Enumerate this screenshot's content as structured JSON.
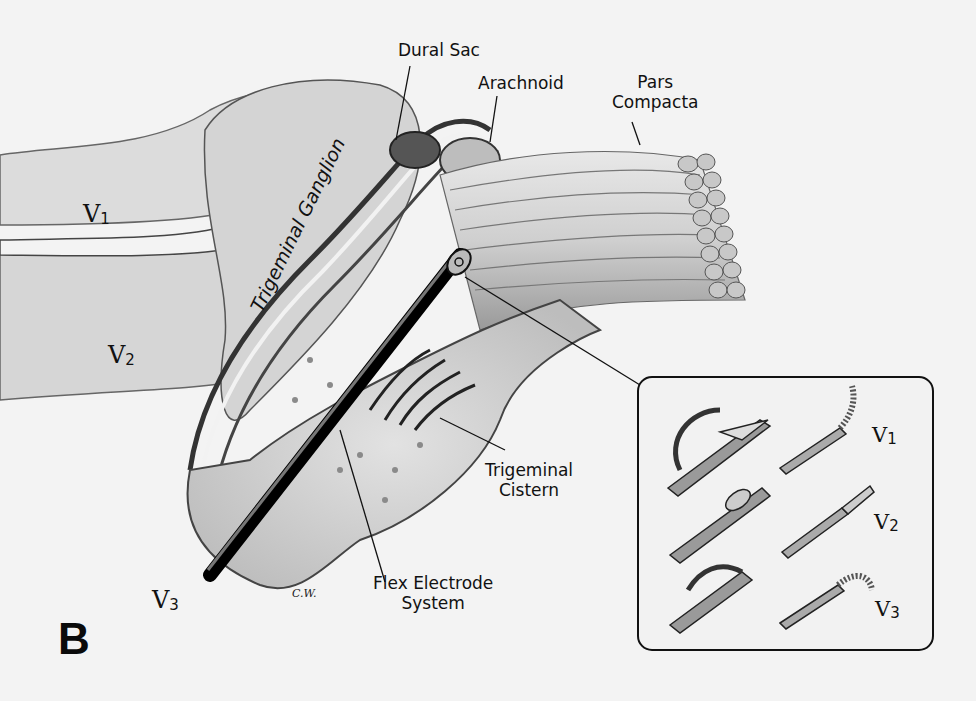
{
  "figure": {
    "panel_label": "B",
    "signature": "C.W.",
    "labels": {
      "dural_sac": "Dural Sac",
      "arachnoid": "Arachnoid",
      "pars_compacta": "Pars\nCompacta",
      "trigeminal_ganglion": "Trigeminal\nGanglion",
      "trigeminal_cistern": "Trigeminal\nCistern",
      "flex_electrode_system": "Flex Electrode\nSystem"
    },
    "nerve_divisions": {
      "v1": {
        "numeral": "V",
        "sub": "1"
      },
      "v2": {
        "numeral": "V",
        "sub": "2"
      },
      "v3": {
        "numeral": "V",
        "sub": "3"
      }
    },
    "inset": {
      "description": "Electrode tip configurations",
      "rows": [
        {
          "division": {
            "numeral": "V",
            "sub": "1"
          }
        },
        {
          "division": {
            "numeral": "V",
            "sub": "2"
          }
        },
        {
          "division": {
            "numeral": "V",
            "sub": "3"
          }
        }
      ]
    }
  }
}
